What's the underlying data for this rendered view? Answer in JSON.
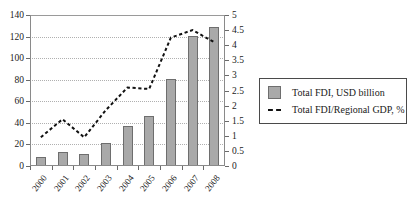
{
  "chart_data": {
    "type": "bar",
    "title": "",
    "xlabel": "",
    "categories": [
      "2000",
      "2001",
      "2002",
      "2003",
      "2004",
      "2005",
      "2006",
      "2007",
      "2008"
    ],
    "grid": true,
    "legend_position": "right",
    "series": [
      {
        "name": "Total FDI, USD billion",
        "type": "bar",
        "axis": "left",
        "color": "#a9a9a9",
        "values": [
          8,
          13,
          11.5,
          21.5,
          37.5,
          46,
          81,
          120.5,
          129
        ]
      },
      {
        "name": "Total FDI/Regional GDP, %",
        "type": "line",
        "style": "dashed",
        "axis": "right",
        "color": "#111111",
        "values": [
          0.95,
          1.55,
          0.95,
          1.85,
          2.6,
          2.55,
          4.25,
          4.5,
          4.1
        ]
      }
    ],
    "left_axis": {
      "label": "",
      "ylim": [
        0,
        140
      ],
      "ticks": [
        "0",
        "20",
        "40",
        "60",
        "80",
        "100",
        "120",
        "140"
      ]
    },
    "right_axis": {
      "label": "",
      "ylim": [
        0,
        5
      ],
      "ticks": [
        "0",
        "0.5",
        "1",
        "1.5",
        "2",
        "2.5",
        "3",
        "3.5",
        "4",
        "4.5",
        "5"
      ]
    }
  },
  "legend": {
    "items": [
      {
        "label": "Total FDI, USD billion",
        "marker": "bar-swatch-icon"
      },
      {
        "label": "Total FDI/Regional GDP, %",
        "marker": "dashed-line-icon"
      }
    ]
  }
}
